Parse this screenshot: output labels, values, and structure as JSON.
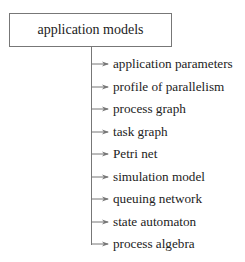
{
  "diagram": {
    "type": "tree",
    "root": {
      "label": "application models"
    },
    "children": [
      {
        "label": "application parameters"
      },
      {
        "label": "profile of parallelism"
      },
      {
        "label": "process graph"
      },
      {
        "label": "task graph"
      },
      {
        "label": "Petri net"
      },
      {
        "label": "simulation model"
      },
      {
        "label": "queuing network"
      },
      {
        "label": "state automaton"
      },
      {
        "label": "process algebra"
      }
    ],
    "colors": {
      "line": "#777777",
      "text": "#222222",
      "background": "#ffffff"
    }
  }
}
